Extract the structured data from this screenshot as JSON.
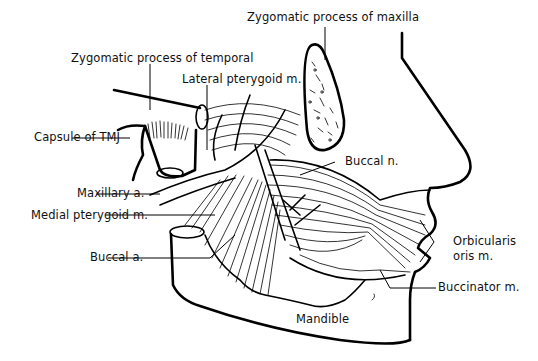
{
  "diagram": {
    "labels": {
      "zygomatic_maxilla": "Zygomatic process of maxilla",
      "zygomatic_temporal": "Zygomatic process of temporal",
      "lateral_pterygoid": "Lateral pterygoid m.",
      "capsule_tmj": "Capsule of TMJ",
      "buccal_nerve": "Buccal n.",
      "maxillary_artery": "Maxillary a.",
      "medial_pterygoid": "Medial pterygoid m.",
      "buccal_artery": "Buccal a.",
      "orbicularis_line1": "Orbicularis",
      "orbicularis_line2": "oris m.",
      "buccinator": "Buccinator m.",
      "mandible": "Mandible"
    },
    "colors": {
      "ink": "#000000",
      "background": "#ffffff"
    }
  }
}
